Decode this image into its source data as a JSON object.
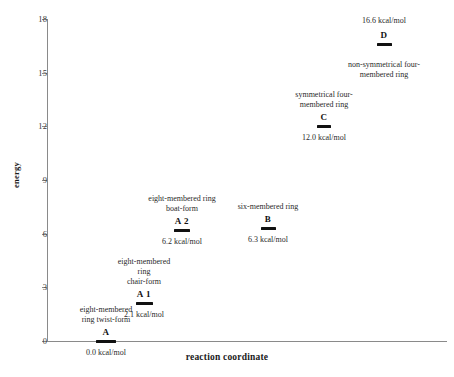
{
  "chart_data": {
    "type": "scatter",
    "title": "",
    "xlabel": "reaction coordinate",
    "ylabel": "energy",
    "ylim": [
      0,
      18
    ],
    "xlim": [
      0,
      1
    ],
    "grid": false,
    "legend": "none",
    "yticks": [
      0,
      3,
      6,
      9,
      12,
      15,
      18
    ],
    "ytick_labels": [
      "0",
      "3",
      "6",
      "9",
      "12",
      "15",
      "18"
    ],
    "xticks": [],
    "xtick_labels": [],
    "units": "kcal/mol",
    "categories": [
      "A",
      "A 1",
      "A 2",
      "B",
      "C",
      "D"
    ],
    "values": [
      0.0,
      2.1,
      6.2,
      6.3,
      12.0,
      16.6
    ],
    "points": [
      {
        "label": "A",
        "value": 0.0,
        "value_text": "0.0 kcal/mol",
        "description": "eight-membered\nring twist-form",
        "desc_line1": "eight-membered",
        "desc_line2": "ring twist-form",
        "desc_line3": "",
        "desc_position": "above",
        "value_position": "below"
      },
      {
        "label": "A 1",
        "value": 2.1,
        "value_text": "2.1 kcal/mol",
        "description": "eight-membered\nring\nchair-form",
        "desc_line1": "eight-membered",
        "desc_line2": "ring",
        "desc_line3": "chair-form",
        "desc_position": "above",
        "value_position": "below"
      },
      {
        "label": "A 2",
        "value": 6.2,
        "value_text": "6.2 kcal/mol",
        "description": "eight-membered ring\nboat-form",
        "desc_line1": "eight-membered ring",
        "desc_line2": "boat-form",
        "desc_line3": "",
        "desc_position": "above",
        "value_position": "below"
      },
      {
        "label": "B",
        "value": 6.3,
        "value_text": "6.3 kcal/mol",
        "description": "six-membered ring",
        "desc_line1": "six-membered ring",
        "desc_line2": "",
        "desc_line3": "",
        "desc_position": "above",
        "value_position": "below"
      },
      {
        "label": "C",
        "value": 12.0,
        "value_text": "12.0 kcal/mol",
        "description": "symmetrical four-\nmembered ring",
        "desc_line1": "symmetrical four-",
        "desc_line2": "membered ring",
        "desc_line3": "",
        "desc_position": "above",
        "value_position": "below"
      },
      {
        "label": "D",
        "value": 16.6,
        "value_text": "16.6 kcal/mol",
        "description": "non-symmetrical four-\nmembered ring",
        "desc_line1": "non-symmetrical four-",
        "desc_line2": "membered ring",
        "desc_line3": "",
        "desc_position": "below",
        "value_position": "above"
      }
    ]
  },
  "colors": {
    "axis": "#8a8a8a",
    "marker": "#111111",
    "text": "#2a2a2a",
    "background": "#ffffff"
  }
}
